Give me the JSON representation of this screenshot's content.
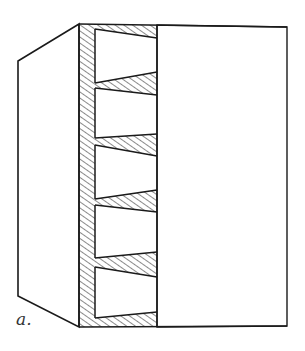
{
  "figure": {
    "label": "a.",
    "colors": {
      "line": "#1a1a1a",
      "hatch": "#2a2a2a",
      "background": "#ffffff"
    },
    "wedge_count": 6
  }
}
